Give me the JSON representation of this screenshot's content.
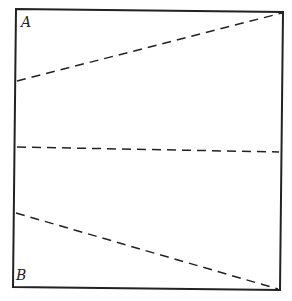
{
  "diagram": {
    "labels": {
      "top_left": "A",
      "bottom_left": "B"
    },
    "colors": {
      "stroke": "#222222",
      "background": "#ffffff"
    },
    "square": {
      "corners": [
        [
          16,
          9
        ],
        [
          283,
          12
        ],
        [
          280,
          290
        ],
        [
          13,
          287
        ]
      ]
    },
    "dashed_lines": [
      {
        "from": [
          17,
          81
        ],
        "to": [
          282,
          13
        ]
      },
      {
        "from": [
          17,
          147
        ],
        "to": [
          279,
          152
        ]
      },
      {
        "from": [
          16,
          213
        ],
        "to": [
          278,
          289
        ]
      }
    ]
  }
}
